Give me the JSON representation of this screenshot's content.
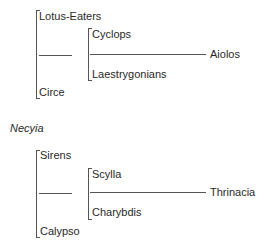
{
  "groups": [
    {
      "outer_top": "Lotus-Eaters",
      "outer_bottom": "Circe",
      "inner_top": "Cyclops",
      "inner_bottom": "Laestrygonians",
      "target": "Aiolos"
    },
    {
      "outer_top": "Sirens",
      "outer_bottom": "Calypso",
      "inner_top": "Scylla",
      "inner_bottom": "Charybdis",
      "target": "Thrinacia"
    }
  ],
  "divider_label": "Necyia"
}
